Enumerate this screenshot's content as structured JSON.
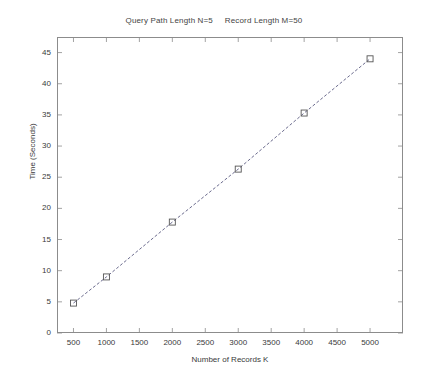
{
  "chart_data": {
    "type": "line",
    "title": "Query Path Length N=5     Record Length M=50",
    "xlabel": "Number of Records K",
    "ylabel": "Time (Seconds)",
    "x": [
      500,
      1000,
      2000,
      3000,
      4000,
      5000
    ],
    "values": [
      4.8,
      9.0,
      17.8,
      26.3,
      35.3,
      44.0
    ],
    "series": [
      {
        "name": "Time",
        "x": [
          500,
          1000,
          2000,
          3000,
          4000,
          5000
        ],
        "values": [
          4.8,
          9.0,
          17.8,
          26.3,
          35.3,
          44.0
        ]
      }
    ],
    "xlim": [
      250,
      5500
    ],
    "ylim": [
      0,
      47.5
    ],
    "xticks": [
      500,
      1000,
      1500,
      2000,
      2500,
      3000,
      3500,
      4000,
      4500,
      5000
    ],
    "xtick_labels": [
      "500",
      "1000",
      "1500",
      "2000",
      "2500",
      "3000",
      "3500",
      "4000",
      "4500",
      "5000"
    ],
    "yticks": [
      0,
      5,
      10,
      15,
      20,
      25,
      30,
      35,
      40,
      45
    ],
    "ytick_labels": [
      "0",
      "5",
      "10",
      "15",
      "20",
      "25",
      "30",
      "35",
      "40",
      "45"
    ],
    "grid": false,
    "legend": false,
    "marker": "square",
    "line_style": "dashed",
    "line_color": "#5a5a80",
    "marker_color": "#555555",
    "axis_color": "#8c8c8c",
    "background": "#ffffff"
  },
  "figure": {
    "title": "Query Path Length N=5     Record Length M=50",
    "xlabel": "Number of Records K",
    "ylabel": "Time (Seconds)"
  }
}
